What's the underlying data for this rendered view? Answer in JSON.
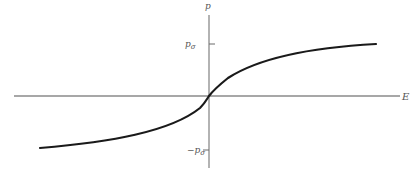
{
  "diagram": {
    "type": "polarization-vs-field curve",
    "axes": {
      "x_label": "E",
      "y_label": "p",
      "origin": [
        209,
        96
      ]
    },
    "ticks": {
      "upper": {
        "label_main": "p",
        "label_sub": "σ",
        "y": 44
      },
      "lower": {
        "label_prefix": "−",
        "label_main": "p",
        "label_sub": "σ",
        "y": 150
      }
    },
    "curve": {
      "description": "Saturating odd function through origin, approaching +p_σ for large positive E and −p_σ for large negative E",
      "color": "#1a1a1a"
    },
    "colors": {
      "axis": "#8a8a8a",
      "curve": "#1a1a1a",
      "label": "#555555"
    }
  }
}
